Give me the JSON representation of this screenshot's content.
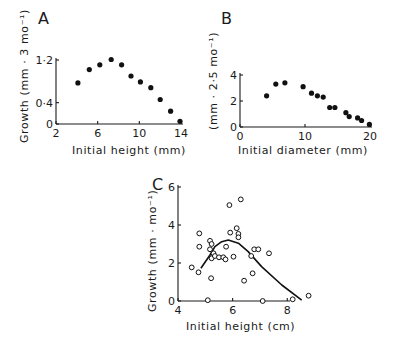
{
  "chart_data": [
    {
      "panel": "A",
      "type": "scatter",
      "title": "A",
      "xlabel": "Initial height (mm)",
      "ylabel": "Growth (mm · 3 mo⁻¹)",
      "xlim": [
        2,
        14
      ],
      "ylim": [
        0,
        1.2
      ],
      "xticks": [
        "2",
        "6",
        "10",
        "14"
      ],
      "yticks": [
        "0",
        "0·4",
        "1·2"
      ],
      "grid": false,
      "marker": "filled-circle",
      "x": [
        4.1,
        5.2,
        6.2,
        7.3,
        8.3,
        9.2,
        10.1,
        11.1,
        12.0,
        13.0,
        13.9
      ],
      "y": [
        0.77,
        1.02,
        1.11,
        1.21,
        1.11,
        0.9,
        0.79,
        0.68,
        0.46,
        0.24,
        0.05
      ]
    },
    {
      "panel": "B",
      "type": "scatter",
      "title": "B",
      "xlabel": "Initial diameter (mm)",
      "ylabel": "(mm · 2·5 mo⁻¹)",
      "xlim": [
        0,
        20
      ],
      "ylim": [
        0,
        4
      ],
      "xticks": [
        "0",
        "10",
        "20"
      ],
      "yticks": [
        "0",
        "2",
        "4"
      ],
      "grid": false,
      "marker": "filled-circle",
      "x": [
        4.1,
        5.5,
        6.9,
        9.7,
        11.0,
        11.9,
        12.8,
        13.8,
        14.6,
        16.3,
        16.8,
        18.1,
        18.7,
        19.9
      ],
      "y": [
        2.4,
        3.3,
        3.4,
        3.1,
        2.6,
        2.4,
        2.3,
        1.5,
        1.5,
        1.1,
        0.8,
        0.7,
        0.5,
        0.2
      ]
    },
    {
      "panel": "C",
      "type": "scatter",
      "title": "C",
      "xlabel": "Initial height (cm)",
      "ylabel": "Growth (mm · mo⁻¹)",
      "xlim": [
        4,
        8.1
      ],
      "ylim": [
        0,
        6
      ],
      "xticks": [
        "4",
        "6",
        "8"
      ],
      "yticks": [
        "0",
        "2",
        "4",
        "6"
      ],
      "grid": false,
      "marker": "open-circle",
      "x": [
        4.5,
        4.75,
        4.78,
        4.78,
        5.09,
        5.17,
        5.17,
        5.21,
        5.23,
        5.23,
        5.3,
        5.35,
        5.5,
        5.66,
        5.74,
        5.76,
        5.88,
        5.91,
        6.03,
        6.15,
        6.21,
        6.21,
        6.3,
        6.42,
        6.68,
        6.73,
        6.79,
        6.94,
        7.1,
        7.33,
        8.2,
        8.78
      ],
      "y": [
        1.77,
        1.51,
        3.56,
        2.86,
        0.04,
        3.17,
        2.72,
        1.2,
        3.0,
        2.25,
        2.51,
        2.37,
        2.3,
        2.3,
        2.19,
        2.86,
        5.05,
        3.6,
        2.33,
        3.83,
        3.53,
        3.35,
        5.35,
        1.07,
        2.37,
        1.46,
        2.72,
        2.72,
        0.0,
        2.51,
        0.09,
        0.28
      ],
      "fit_curve": {
        "type": "line",
        "x": [
          4.84,
          5.17,
          5.35,
          5.6,
          5.84,
          6.21,
          6.57,
          7.06,
          7.8,
          8.53
        ],
        "y": [
          1.72,
          2.42,
          2.86,
          3.12,
          3.21,
          3.04,
          2.6,
          1.81,
          0.84,
          0.05
        ]
      }
    }
  ]
}
